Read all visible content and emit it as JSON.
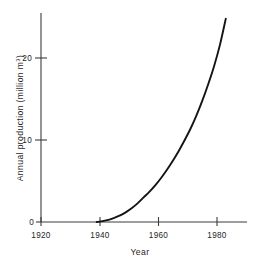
{
  "figure": {
    "background_color": "#ffffff",
    "line_color": "#141414",
    "axis_color": "#3c3c3c"
  },
  "chart_data": {
    "type": "line",
    "title": "",
    "subtitle": "",
    "xlabel": "Year",
    "ylabel": "Annual production (million m³)",
    "ylabel_text": "Annual production (million m",
    "ylabel_superscript": "3",
    "ylabel_suffix": ")",
    "xlim": [
      1920,
      1990
    ],
    "ylim": [
      0,
      26
    ],
    "xticks": [
      1920,
      1940,
      1960,
      1980
    ],
    "xticklabels": [
      "1920",
      "1940",
      "1960",
      "1980"
    ],
    "yticks": [
      0,
      10,
      20
    ],
    "yticklabels": [
      "0",
      "10",
      "20"
    ],
    "grid": false,
    "legend": "none",
    "series": [
      {
        "name": "Annual production",
        "x": [
          1939,
          1941,
          1943,
          1945,
          1947,
          1949,
          1951,
          1953,
          1955,
          1957,
          1959,
          1961,
          1963,
          1965,
          1967,
          1969,
          1971,
          1973,
          1975,
          1977,
          1979,
          1981,
          1983
        ],
        "values": [
          0.0,
          0.1,
          0.25,
          0.5,
          0.8,
          1.2,
          1.7,
          2.3,
          3.0,
          3.7,
          4.5,
          5.4,
          6.4,
          7.5,
          8.7,
          10.0,
          11.4,
          13.0,
          14.8,
          16.8,
          19.0,
          21.6,
          24.8
        ]
      }
    ]
  },
  "axes": {
    "x_tick_positions_px": [
      41,
      100,
      158.5,
      217
    ],
    "y_tick_positions_px": [
      222,
      140,
      58
    ],
    "origin_px": {
      "x": 41,
      "y": 222
    },
    "x_axis_end_px": 247,
    "y_axis_top_px": 13
  }
}
